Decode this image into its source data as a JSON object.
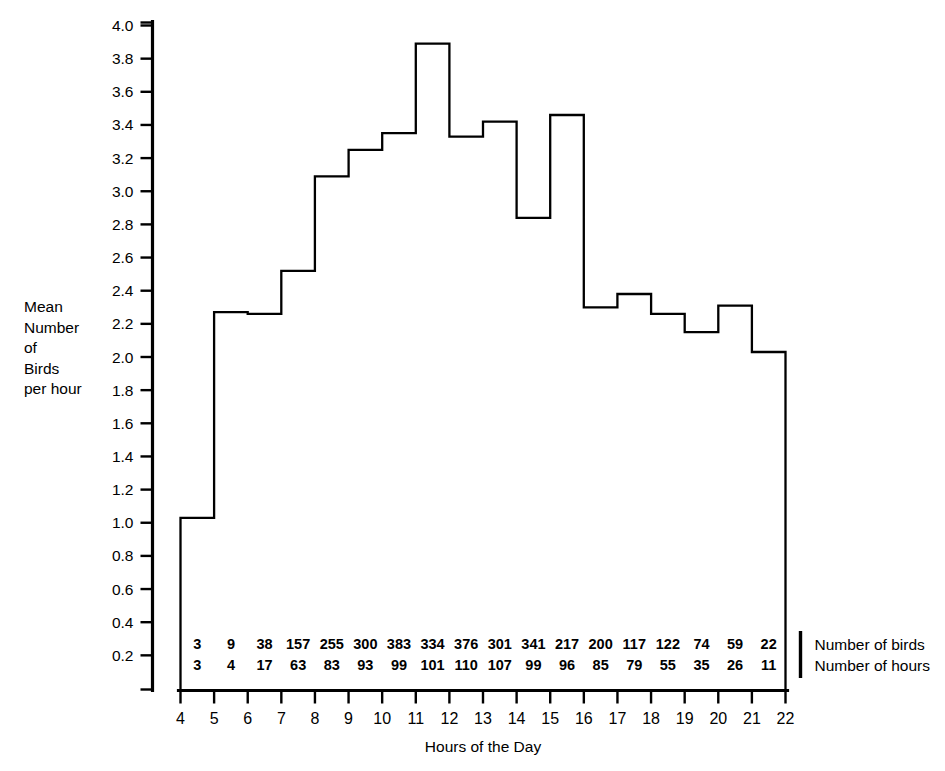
{
  "chart_data": {
    "type": "line",
    "subtype": "step",
    "title": "",
    "xlabel": "Hours of the Day",
    "ylabel": "Mean Number of Birds per hour",
    "ylabel_lines": [
      "Mean",
      "Number",
      "of",
      "Birds",
      "per hour"
    ],
    "xlim": [
      4,
      22
    ],
    "ylim": [
      0.0,
      4.0
    ],
    "grid": false,
    "legend": "none",
    "x_ticks": [
      4,
      5,
      6,
      7,
      8,
      9,
      10,
      11,
      12,
      13,
      14,
      15,
      16,
      17,
      18,
      19,
      20,
      21,
      22
    ],
    "y_ticks": [
      0.2,
      0.4,
      0.6,
      0.8,
      1.0,
      1.2,
      1.4,
      1.6,
      1.8,
      2.0,
      2.2,
      2.4,
      2.6,
      2.8,
      3.0,
      3.2,
      3.4,
      3.6,
      3.8,
      4.0
    ],
    "y_tick_labels": [
      "0.2",
      "0.4",
      "0.6",
      "0.8",
      "1.0",
      "1.2",
      "1.4",
      "1.6",
      "1.8",
      "2.0",
      "2.2",
      "2.4",
      "2.6",
      "2.8",
      "3.0",
      "3.2",
      "3.4",
      "3.6",
      "3.8",
      "4.0"
    ],
    "bin_starts": [
      4,
      5,
      6,
      7,
      8,
      9,
      10,
      11,
      12,
      13,
      14,
      15,
      16,
      17,
      18,
      19,
      20,
      21
    ],
    "bin_ends": [
      5,
      6,
      7,
      8,
      9,
      10,
      11,
      12,
      13,
      14,
      15,
      16,
      17,
      18,
      19,
      20,
      21,
      22
    ],
    "bin_labels": [
      "4-5",
      "5-6",
      "6-7",
      "7-8",
      "8-9",
      "9-10",
      "10-11",
      "11-12",
      "12-13",
      "13-14",
      "14-15",
      "15-16",
      "16-17",
      "17-18",
      "18-19",
      "19-20",
      "20-21",
      "21-22"
    ],
    "values": [
      1.03,
      2.27,
      2.26,
      2.52,
      3.09,
      3.25,
      3.35,
      3.89,
      3.33,
      3.42,
      2.84,
      3.46,
      2.3,
      2.38,
      2.26,
      2.15,
      2.31,
      2.03
    ],
    "series": [
      {
        "name": "Mean Number of Birds per hour",
        "values": [
          1.03,
          2.27,
          2.26,
          2.52,
          3.09,
          3.25,
          3.35,
          3.89,
          3.33,
          3.42,
          2.84,
          3.46,
          2.3,
          2.38,
          2.26,
          2.15,
          2.31,
          2.03
        ]
      }
    ],
    "annotation_rows": [
      {
        "label": "Number of birds",
        "values": [
          3,
          9,
          38,
          157,
          255,
          300,
          383,
          334,
          376,
          301,
          341,
          217,
          200,
          117,
          122,
          74,
          59,
          22
        ]
      },
      {
        "label": "Number of hours",
        "values": [
          3,
          4,
          17,
          63,
          83,
          93,
          99,
          101,
          110,
          107,
          99,
          96,
          85,
          79,
          55,
          35,
          26,
          11
        ]
      }
    ]
  },
  "axes": {
    "x_title": "Hours of the Day"
  },
  "colors": {
    "line": "#000000",
    "background": "#ffffff",
    "text": "#000000"
  }
}
